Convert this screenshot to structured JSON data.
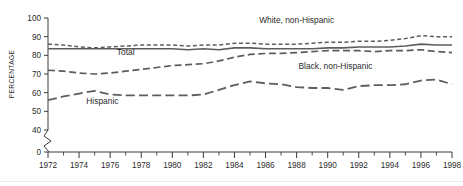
{
  "chart_data": {
    "type": "line",
    "title": "",
    "subtitle": "",
    "xlabel": "",
    "ylabel": "PERCENTAGE",
    "xlim": [
      1972,
      1998
    ],
    "ylim": [
      40,
      100
    ],
    "y_axis_break_below": 40,
    "y_zero_shown": true,
    "grid": false,
    "legend_position": "inline-annotations",
    "y_ticks": [
      "100",
      "90",
      "80",
      "70",
      "60",
      "50",
      "40",
      "0"
    ],
    "y_tick_values": [
      100,
      90,
      80,
      70,
      60,
      50,
      40,
      0
    ],
    "x_ticks": [
      "1972",
      "1974",
      "1976",
      "1978",
      "1980",
      "1982",
      "1984",
      "1986",
      "1988",
      "1990",
      "1992",
      "1994",
      "1996",
      "1998"
    ],
    "x_tick_values": [
      1972,
      1974,
      1976,
      1978,
      1980,
      1982,
      1984,
      1986,
      1988,
      1990,
      1992,
      1994,
      1996,
      1998
    ],
    "x_minor_tick_values": [
      1973,
      1975,
      1977,
      1979,
      1981,
      1983,
      1985,
      1987,
      1989,
      1991,
      1993,
      1995,
      1997
    ],
    "x": [
      1972,
      1973,
      1974,
      1975,
      1976,
      1977,
      1978,
      1979,
      1980,
      1981,
      1982,
      1983,
      1984,
      1985,
      1986,
      1987,
      1988,
      1989,
      1990,
      1991,
      1992,
      1993,
      1994,
      1995,
      1996,
      1997,
      1998
    ],
    "series": [
      {
        "name": "White, non-Hispanic",
        "style": "short-dash",
        "dash": "4 2.6",
        "width": 1.5,
        "color": "#5d5d5d",
        "label_x": 1988.0,
        "label_y": 97.5,
        "values": [
          86.0,
          85.5,
          84.5,
          84.0,
          84.5,
          85.0,
          85.5,
          85.5,
          85.5,
          85.0,
          85.5,
          85.5,
          86.5,
          86.5,
          86.0,
          86.0,
          86.0,
          86.5,
          87.0,
          87.0,
          87.5,
          87.5,
          88.0,
          89.0,
          90.5,
          90.0,
          90.0
        ]
      },
      {
        "name": "Total",
        "style": "solid",
        "dash": "none",
        "width": 1.6,
        "color": "#4a4a4a",
        "label_x": 1977.0,
        "label_y": 80.0,
        "values": [
          83.5,
          83.5,
          83.5,
          83.5,
          83.5,
          83.5,
          83.5,
          83.5,
          83.5,
          83.0,
          83.5,
          83.0,
          84.0,
          84.0,
          83.5,
          83.5,
          83.5,
          83.5,
          84.0,
          84.0,
          84.5,
          84.5,
          84.5,
          85.0,
          86.0,
          85.5,
          85.5
        ]
      },
      {
        "name": "Black, non-Hispanic",
        "style": "medium-dash",
        "dash": "7 3.6",
        "width": 1.7,
        "color": "#5d5d5d",
        "label_x": 1990.5,
        "label_y": 72.5,
        "values": [
          72.0,
          71.5,
          70.5,
          70.0,
          70.5,
          71.5,
          72.5,
          73.5,
          74.5,
          75.0,
          75.5,
          77.0,
          79.0,
          80.5,
          81.0,
          81.0,
          81.5,
          82.0,
          82.5,
          82.5,
          82.5,
          82.0,
          82.5,
          82.5,
          83.0,
          82.0,
          81.5
        ]
      },
      {
        "name": "Hispanic",
        "style": "long-dash",
        "dash": "9 4.2",
        "width": 1.8,
        "color": "#5d5d5d",
        "label_x": 1975.5,
        "label_y": 54.0,
        "values": [
          56.0,
          58.0,
          59.5,
          61.0,
          59.0,
          58.5,
          58.5,
          58.5,
          58.5,
          58.5,
          59.0,
          61.5,
          64.0,
          66.0,
          65.0,
          64.5,
          63.0,
          62.5,
          62.5,
          61.5,
          63.5,
          64.0,
          64.0,
          64.5,
          66.5,
          67.0,
          64.5
        ]
      }
    ],
    "annotations": [
      {
        "text": "White, non-Hispanic",
        "x": 1988.0,
        "y": 97.5
      },
      {
        "text": "Total",
        "x": 1977.0,
        "y": 80.0
      },
      {
        "text": "Black, non-Hispanic",
        "x": 1990.5,
        "y": 72.5
      },
      {
        "text": "Hispanic",
        "x": 1975.5,
        "y": 54.0
      }
    ],
    "colors": {
      "axis": "#3a3a3a",
      "line": "#5d5d5d",
      "text": "#2b2b2b",
      "background": "#ffffff"
    }
  }
}
